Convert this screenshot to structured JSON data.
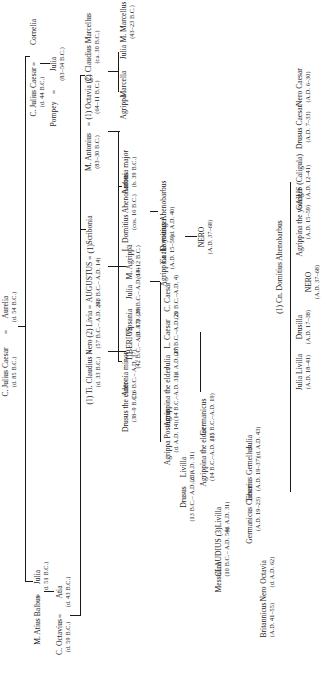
{
  "diagram": {
    "title": "",
    "type": "family-tree",
    "orientation": "rotated-90-ccw",
    "line_color": "#1a1a1a",
    "background": "#ffffff",
    "people": {
      "p_jcaesar_sr": {
        "name": "C. Julius Caesar",
        "dates": "(d. 85 B.C.)"
      },
      "p_aurelia": {
        "name": "Aurelia",
        "dates": "(d. 54 B.C.)"
      },
      "p_jcaesar": {
        "name": "C. Julius Caesar",
        "dates": "(d. 44 B.C.)"
      },
      "p_cornelia": {
        "name": "Cornelia",
        "dates": ""
      },
      "p_julia_sister": {
        "name": "Julia",
        "dates": "(d. 51 B.C.)"
      },
      "p_atius": {
        "name": "M. Atius Balbus",
        "dates": ""
      },
      "p_julia_pompey": {
        "name": "Julia",
        "dates": "(83–54 B.C.)"
      },
      "p_pompey": {
        "name": "Pompey",
        "dates": ""
      },
      "p_atia": {
        "name": "Atia",
        "dates": "(d. 43 B.C.)"
      },
      "p_octavius": {
        "name": "C. Octavius",
        "dates": "(d. 59 B.C.)"
      },
      "p_marcellus_sr": {
        "name": "C. Claudius Marcellus",
        "dates": "(ca. 30 B.C.)"
      },
      "p_octavia": {
        "name": "(1) Octavia (2)",
        "dates": "(64–11 B.C.)"
      },
      "p_antonius": {
        "name": "M. Antonius",
        "dates": "(83–30 B.C.)"
      },
      "p_scribonia": {
        "name": "Scribonia",
        "dates": ""
      },
      "p_augustus": {
        "name": "AUGUSTUS",
        "dates": "(63 B.C.– A.D. 14)"
      },
      "p_livia": {
        "name": "(2) Livia",
        "dates": "(57 B.C.– A.D. 29)"
      },
      "p_tiberius_nero": {
        "name": "(1) Ti. Claudius Nero",
        "dates": "(d. 33 B.C.)"
      },
      "p_marcellus": {
        "name": "M. Marcellus",
        "dates": "(43–23 B.C.)"
      },
      "p_julia_m": {
        "name": "Julia",
        "dates": ""
      },
      "p_marcella": {
        "name": "Marcella",
        "dates": ""
      },
      "p_agrippa_m": {
        "name": "Agrippa",
        "dates": ""
      },
      "p_antonia_major": {
        "name": "Antonia major",
        "dates": "(b. 39 B.C.)"
      },
      "p_ahenobarbus_l": {
        "name": "L. Domitius Ahenobarbus",
        "dates": "(cos. 16 B.C.)"
      },
      "p_antonia_minor": {
        "name": "Antonia minor",
        "dates": "(36 B.C.– A.D. 37)"
      },
      "p_drusus_elder": {
        "name": "Drusus the elder",
        "dates": "(38–9 B.C.)"
      },
      "p_agrippa": {
        "name": "M. Agrippa",
        "dates": "(63–12 B.C.)"
      },
      "p_julia_aug": {
        "name": "Julia",
        "dates": "(39 B.C.– A.D. 14)"
      },
      "p_vipsania": {
        "name": "Vipsania",
        "dates": "(d. A.D. 20)"
      },
      "p_tiberius": {
        "name": "TIBERIUS",
        "dates": "(42 B.C.– A.D. 37)"
      },
      "p_cn_domitius": {
        "name": "Cn. Domitius Ahenobarbus",
        "dates": "(d. A.D. 40)"
      },
      "p_agrippina_y": {
        "name": "Agrippina the younger",
        "dates": "(A.D. 15–59)"
      },
      "p_c_caesar": {
        "name": "C. Caesar",
        "dates": "(20 B.C.–A.D. 4)"
      },
      "p_l_caesar": {
        "name": "L. Caesar",
        "dates": "(17 B.C.–A.D. 2)"
      },
      "p_julia_d28": {
        "name": "Julia",
        "dates": "(d. A.D. 28)"
      },
      "p_agrippina_e": {
        "name": "Agrippina the elder",
        "dates": "(14 B.C.–A.D. 33)"
      },
      "p_agrippa_post": {
        "name": "Agrippa Postumus",
        "dates": "(d. A.D. 14)"
      },
      "p_livilla": {
        "name": "Livilla",
        "dates": "(d. A.D. 31)"
      },
      "p_drusus": {
        "name": "Drusus",
        "dates": "(13 B.C.– A.D. 23)"
      },
      "p_germanicus": {
        "name": "Germanicus",
        "dates": "(15 B.C.–A.D. 19)"
      },
      "p_agrippina_e2": {
        "name": "Agrippina the elder",
        "dates": "(14 B.C.–A.D. 33)"
      },
      "p_livilla2": {
        "name": "Livilla",
        "dates": "(d. A.D. 31)"
      },
      "p_claudius": {
        "name": "CLAUDIUS (3)",
        "dates": "(10 B.C.– A.D. 54)"
      },
      "p_messalina": {
        "name": "Messalina",
        "dates": ""
      },
      "p_nero_top": {
        "name": "NERO",
        "dates": "(A.D. 37–68)"
      },
      "p_julia_d43": {
        "name": "Julia",
        "dates": "(d. A.D. 43)"
      },
      "p_gemellus": {
        "name": "Tiberius Gemellus",
        "dates": "(A.D. 19–37)"
      },
      "p_germanicus_c": {
        "name": "Germanicus Caesar",
        "dates": "(A.D. 19–23)"
      },
      "p_nero_caesar": {
        "name": "Nero Caesar",
        "dates": "(A.D. 6–30)"
      },
      "p_drusus_caesar": {
        "name": "Drusus Caesar",
        "dates": "(A.D. 7–33)"
      },
      "p_gaius": {
        "name": "GAIUS (Caligula)",
        "dates": "(A.D. 12–41)"
      },
      "p_agrippina_y2": {
        "name": "Agrippina the younger",
        "dates": "(A.D. 15–59)"
      },
      "p_cn_domitius2": {
        "name": "(1) Cn. Domitius Ahenobarbus",
        "dates": ""
      },
      "p_nero": {
        "name": "NERO",
        "dates": "(A.D. 37–68)"
      },
      "p_drusilla": {
        "name": "Drusilla",
        "dates": "(A.D. 17–38)"
      },
      "p_julia_livilla": {
        "name": "Julia Livilla",
        "dates": "(A.D. 18–41)"
      },
      "p_octavia_c": {
        "name": "Octavia",
        "dates": "(d. A.D. 62)"
      },
      "p_nero_sp": {
        "name": "Nero",
        "dates": ""
      },
      "p_britannicus": {
        "name": "Britannicus",
        "dates": "(A.D. 41–55)"
      }
    }
  }
}
